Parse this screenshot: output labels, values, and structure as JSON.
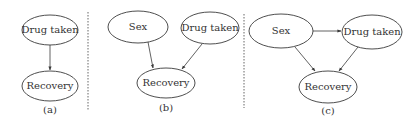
{
  "panels": [
    {
      "caption": "(a)",
      "nodes": [
        {
          "id": "drug",
          "label": "Drug taken"
        },
        {
          "id": "recovery",
          "label": "Recovery"
        }
      ],
      "edges": [
        {
          "from": "drug",
          "to": "recovery"
        }
      ]
    },
    {
      "caption": "(b)",
      "nodes": [
        {
          "id": "sex",
          "label": "Sex"
        },
        {
          "id": "drug",
          "label": "Drug taken"
        },
        {
          "id": "recovery",
          "label": "Recovery"
        }
      ],
      "edges": [
        {
          "from": "sex",
          "to": "recovery"
        },
        {
          "from": "drug",
          "to": "recovery"
        }
      ]
    },
    {
      "caption": "(c)",
      "nodes": [
        {
          "id": "sex",
          "label": "Sex"
        },
        {
          "id": "drug",
          "label": "Drug taken"
        },
        {
          "id": "recovery",
          "label": "Recovery"
        }
      ],
      "edges": [
        {
          "from": "sex",
          "to": "drug"
        },
        {
          "from": "sex",
          "to": "recovery"
        },
        {
          "from": "drug",
          "to": "recovery"
        }
      ]
    }
  ]
}
